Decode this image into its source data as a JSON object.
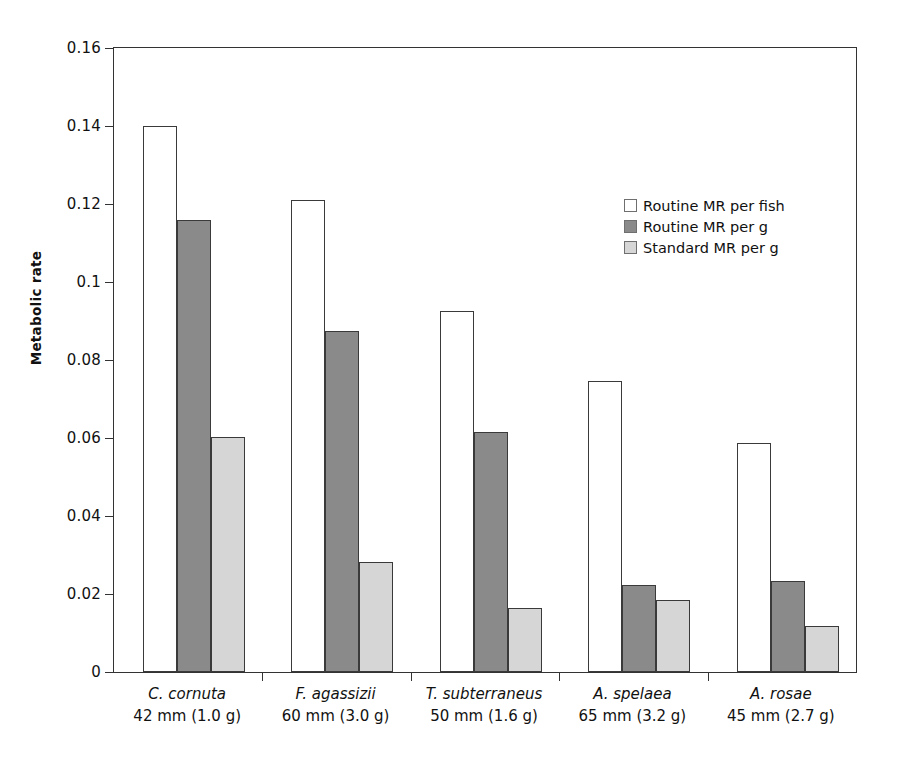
{
  "chart_data": {
    "type": "bar",
    "title": "",
    "subtitle": "",
    "xlabel": "",
    "ylabel": "Metabolic rate",
    "ylim": [
      0,
      0.16
    ],
    "yticks": [
      "0",
      "0.02",
      "0.04",
      "0.06",
      "0.08",
      "0.1",
      "0.12",
      "0.14",
      "0.16"
    ],
    "ytick_values": [
      0,
      0.02,
      0.04,
      0.06,
      0.08,
      0.1,
      0.12,
      0.14,
      0.16
    ],
    "grid": false,
    "legend_position": "inside-upper-right",
    "categories": [
      "C. cornuta 42 mm (1.0 g)",
      "F. agassizii 60 mm (3.0 g)",
      "T. subterraneus 50 mm (1.6 g)",
      "A. spelaea 65 mm (3.2 g)",
      "A. rosae 45 mm (2.7 g)"
    ],
    "category_labels": [
      {
        "species": "C. cornuta",
        "size": "42 mm (1.0 g)"
      },
      {
        "species": "F. agassizii",
        "size": "60 mm (3.0 g)"
      },
      {
        "species": "T. subterraneus",
        "size": "50 mm (1.6 g)"
      },
      {
        "species": "A. spelaea",
        "size": "65 mm (3.2 g)"
      },
      {
        "species": "A. rosae",
        "size": "45 mm (2.7 g)"
      }
    ],
    "series": [
      {
        "name": "Routine MR per fish",
        "color": "#ffffff",
        "values": [
          0.14,
          0.121,
          0.0925,
          0.0745,
          0.0587
        ]
      },
      {
        "name": "Routine MR per g",
        "color": "#8a8a8a",
        "values": [
          0.116,
          0.0875,
          0.0615,
          0.0224,
          0.0233
        ]
      },
      {
        "name": "Standard MR per g",
        "color": "#d6d6d6",
        "values": [
          0.0602,
          0.0282,
          0.0163,
          0.0185,
          0.0117
        ]
      }
    ]
  },
  "legend": {
    "entries": [
      {
        "label": "Routine MR per fish"
      },
      {
        "label": "Routine MR per g"
      },
      {
        "label": "Standard MR per g"
      }
    ]
  },
  "colors": {
    "series_0": "#ffffff",
    "series_1": "#8a8a8a",
    "series_2": "#d6d6d6",
    "axis": "#333333",
    "text": "#111111",
    "background": "#ffffff"
  }
}
